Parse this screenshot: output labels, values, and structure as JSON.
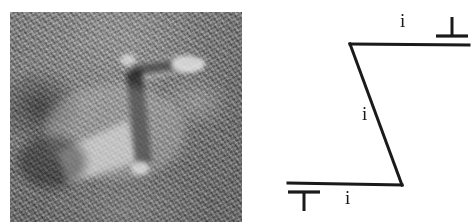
{
  "figure": {
    "panels": [
      {
        "id": "micrograph",
        "kind": "image",
        "description": "High-resolution lattice-fringe micrograph showing a Z-shaped bright defect contrast",
        "background_color": "#6d6d6d",
        "bright_color": "#f2f2f2",
        "dark_color": "#1e1e1e"
      },
      {
        "id": "schematic",
        "kind": "line-diagram",
        "description": "Z-shaped dislocation line terminating in edge-dislocation symbols"
      }
    ]
  },
  "schematic": {
    "stroke_color": "#1a1a1a",
    "labels": {
      "i_top": "i",
      "i_middle": "i",
      "i_bottom": "i"
    },
    "symbols": {
      "top_right": "⊥",
      "bottom_left": "⊤"
    },
    "geometry": {
      "top_segment": {
        "x1": 88,
        "y1": 44,
        "x2": 206,
        "y2": 44
      },
      "inclined_segment": {
        "x1": 88,
        "y1": 44,
        "x2": 139,
        "y2": 184
      },
      "bottom_segment": {
        "x1": 26,
        "y1": 183,
        "x2": 139,
        "y2": 184
      }
    }
  }
}
